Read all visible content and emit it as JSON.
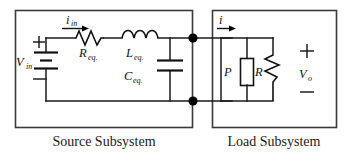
{
  "figure": {
    "type": "circuit-schematic"
  },
  "captions": {
    "source": "Source Subsystem",
    "load": "Load Subsystem"
  },
  "source_subsystem": {
    "voltage_source": {
      "symbol": "battery",
      "label_main": "V",
      "label_sub": "in",
      "plus": "+",
      "minus": "−"
    },
    "current": {
      "label_main": "i",
      "label_sub": "in",
      "direction": "right"
    },
    "resistor": {
      "symbol": "zigzag",
      "label_main": "R",
      "label_sub": "eq."
    },
    "inductor": {
      "symbol": "coil",
      "label_main": "L",
      "label_sub": "eq."
    },
    "capacitor": {
      "symbol": "parallel-plate",
      "label_main": "C",
      "label_sub": "eq."
    }
  },
  "load_subsystem": {
    "current": {
      "label_main": "i",
      "label_sub": "",
      "direction": "right"
    },
    "power_load": {
      "symbol": "rectangle",
      "label_main": "P",
      "label_sub": ""
    },
    "resistor": {
      "symbol": "zigzag",
      "label_main": "R",
      "label_sub": ""
    },
    "output_voltage": {
      "label_main": "V",
      "label_sub": "o",
      "plus": "+",
      "minus": "−"
    }
  },
  "nodes": {
    "top_terminal": "●",
    "bottom_terminal": "●"
  },
  "colors": {
    "wire": "#1a1a1a",
    "box": "#3a3a3a",
    "background": "#ffffff",
    "node": "#000000"
  }
}
